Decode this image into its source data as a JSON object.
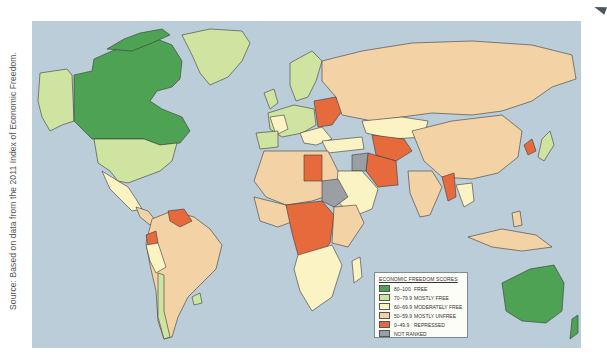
{
  "source_text": "Source: Based on data from the 2011 Index of Economic Freedom.",
  "map": {
    "ocean_color": "#bacdd9",
    "border_color": "#3a3a3a"
  },
  "legend": {
    "title": "ECONOMIC FREEDOM SCORES",
    "items": [
      {
        "range": "80–100",
        "label": "FREE",
        "color": "#4ea253"
      },
      {
        "range": "70–79.9",
        "label": "MOSTLY FREE",
        "color": "#cfe4a0"
      },
      {
        "range": "60–69.9",
        "label": "MODERATELY FREE",
        "color": "#fbf3c4"
      },
      {
        "range": "50–59.9",
        "label": "MOSTLY UNFREE",
        "color": "#f3d3a5"
      },
      {
        "range": "0–49.9",
        "label": "REPRESSED",
        "color": "#e76a3d"
      },
      {
        "range": "",
        "label": "NOT RANKED",
        "color": "#9a9fa3"
      }
    ]
  }
}
